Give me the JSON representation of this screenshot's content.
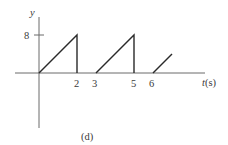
{
  "chart_data": {
    "type": "line",
    "title": "",
    "caption": "(d)",
    "xlabel_var": "t",
    "xlabel_unit": "(s)",
    "xlabel": "t(s)",
    "ylabel": "y",
    "x_ticks": [
      "2",
      "3",
      "5",
      "6"
    ],
    "y_ticks": [
      "8"
    ],
    "grid": false,
    "legend": null,
    "series": [
      {
        "name": "y(t)",
        "segments": [
          {
            "x": [
              0,
              2,
              2
            ],
            "y": [
              0,
              8,
              0
            ]
          },
          {
            "x": [
              3,
              5,
              5
            ],
            "y": [
              0,
              8,
              0
            ]
          },
          {
            "x": [
              6,
              7
            ],
            "y": [
              0,
              4
            ]
          }
        ]
      }
    ],
    "xlim": [
      -1.3,
      8.7
    ],
    "ylim": [
      -11.6,
      11.6
    ]
  },
  "colors": {
    "axis": "#6b6b6b",
    "signal": "#2a2a2a",
    "text": "#3a3a3a"
  }
}
